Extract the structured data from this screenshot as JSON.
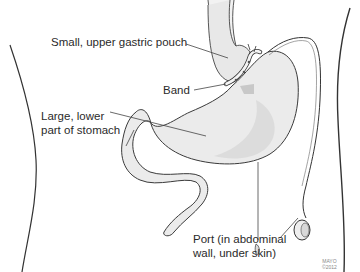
{
  "diagram": {
    "labels": {
      "pouch": "Small, upper gastric pouch",
      "band": "Band",
      "lower_line1": "Large, lower",
      "lower_line2": "part of stomach",
      "port_line1": "Port (in abdominal",
      "port_line2": "wall, under skin)"
    },
    "credit": {
      "line1": "MAYO",
      "line2": "©2012"
    },
    "colors": {
      "outline": "#333333",
      "stomach_fill": "#ececec",
      "shade": "#cfcfcf",
      "text": "#2a2a2a"
    }
  }
}
